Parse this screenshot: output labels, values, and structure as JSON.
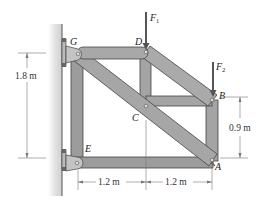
{
  "diagram": {
    "joints": [
      {
        "id": "G",
        "label": "G",
        "x": 77,
        "y": 54
      },
      {
        "id": "D",
        "label": "D",
        "x": 146,
        "y": 52
      },
      {
        "id": "B",
        "label": "B",
        "x": 212,
        "y": 100
      },
      {
        "id": "C",
        "label": "C",
        "x": 146,
        "y": 107
      },
      {
        "id": "E",
        "label": "E",
        "x": 77,
        "y": 163
      },
      {
        "id": "A",
        "label": "A",
        "x": 212,
        "y": 161
      }
    ],
    "members": [
      "GD",
      "GE",
      "EA",
      "GA",
      "DB",
      "DC",
      "CB",
      "BA"
    ],
    "loads": [
      {
        "name": "F",
        "subscript": "1",
        "at": "D"
      },
      {
        "name": "F",
        "subscript": "2",
        "at": "B"
      }
    ],
    "dimensions": {
      "left_height": "1.8 m",
      "right_height": "0.9 m",
      "bottom_left": "1.2 m",
      "bottom_right": "1.2 m"
    },
    "colors": {
      "member_fill": "#9a9a9a",
      "member_edge": "#4a4a4a",
      "wall": "#d9d9d9",
      "wall_edge": "#555555",
      "dimension_line": "#666666",
      "arrow": "#555555"
    }
  }
}
